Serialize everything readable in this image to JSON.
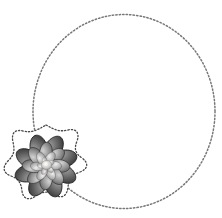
{
  "canvas": {
    "width": 222,
    "height": 218,
    "background_color": "#ffffff",
    "title": "Dotted circle frame with flower accent"
  },
  "frame": {
    "name": "dotted-circle-frame",
    "shape": "circle",
    "center_x": 124,
    "center_y": 111.5,
    "radius_x": 91,
    "radius_y": 97,
    "stroke_color": "#6b6b6b",
    "stroke_style": "dotted",
    "dot_diameter": 1.4,
    "dot_spacing": 2.1,
    "fill": "none"
  },
  "flower": {
    "name": "flower-sticker",
    "type": "lotus-dahlia",
    "palette": "grayscale",
    "center_x": 46,
    "center_y": 166,
    "width": 84,
    "height": 82,
    "petal_layers": 4,
    "petal_count_outer": 8,
    "colors": {
      "darkest": "#2d2d2d",
      "dark": "#4a4a4a",
      "mid": "#7d7d7d",
      "light": "#b4b4b4",
      "lightest": "#e8e8e8",
      "core_highlight": "#f2f0ec"
    },
    "badge": {
      "name": "scalloped-sticker-outline",
      "fill": "#ffffff",
      "stroke_color": "#4a4a4a",
      "stroke_style": "dotted",
      "points": 7
    }
  },
  "legend": {
    "alt_text": "Round dotted frame with a shaded flower at the lower left"
  }
}
